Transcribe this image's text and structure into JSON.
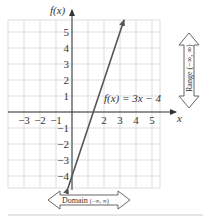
{
  "chart_data": {
    "type": "line",
    "title": "",
    "function_label": "f(x) = 3x − 4",
    "xlabel": "x",
    "ylabel": "f(x)",
    "xlim": [
      -4,
      6
    ],
    "ylim": [
      -4.75,
      5.75
    ],
    "x_ticks": [
      "−3",
      "−2",
      "−1",
      "2",
      "3",
      "4",
      "5"
    ],
    "x_tick_values": [
      -3,
      -2,
      -1,
      2,
      3,
      4,
      5
    ],
    "y_ticks": [
      "5",
      "4",
      "3",
      "2",
      "1",
      "−1",
      "−2",
      "−3",
      "−4"
    ],
    "y_tick_values": [
      5,
      4,
      3,
      2,
      1,
      -1,
      -2,
      -3,
      -4
    ],
    "grid": true,
    "series": [
      {
        "name": "f(x) = 3x − 4",
        "slope": 3,
        "intercept": -4,
        "x": [
          -0.25,
          0,
          1,
          1.333,
          2,
          3,
          3.25
        ],
        "y": [
          -4.75,
          -4,
          -1,
          0,
          2,
          5,
          5.75
        ],
        "arrows_both_ends": true
      }
    ],
    "annotations": [
      {
        "text": "Range (−∞, ∞)",
        "orientation": "vertical",
        "position": "right"
      },
      {
        "text": "Domain (−∞, ∞)",
        "orientation": "horizontal",
        "position": "bottom"
      }
    ]
  },
  "labels": {
    "y_axis": "f(x)",
    "x_axis": "x",
    "function": "f(x) = 3x − 4",
    "range": "Range (−∞, ∞)",
    "domain_word": "Domain",
    "domain_interval": "(−∞, ∞)"
  },
  "ticks": {
    "x": [
      {
        "label": "−3",
        "value": -3
      },
      {
        "label": "−2",
        "value": -2
      },
      {
        "label": "−1",
        "value": -1
      },
      {
        "label": "2",
        "value": 2
      },
      {
        "label": "3",
        "value": 3
      },
      {
        "label": "4",
        "value": 4
      },
      {
        "label": "5",
        "value": 5
      }
    ],
    "y": [
      {
        "label": "5",
        "value": 5
      },
      {
        "label": "4",
        "value": 4
      },
      {
        "label": "3",
        "value": 3
      },
      {
        "label": "2",
        "value": 2
      },
      {
        "label": "1",
        "value": 1
      },
      {
        "label": "−1",
        "value": -1
      },
      {
        "label": "−2",
        "value": -2
      },
      {
        "label": "−3",
        "value": -3
      },
      {
        "label": "−4",
        "value": -4
      }
    ]
  },
  "colors": {
    "line": "#555555",
    "axis": "#333333",
    "grid": "#dddddd",
    "text": "#333333"
  }
}
